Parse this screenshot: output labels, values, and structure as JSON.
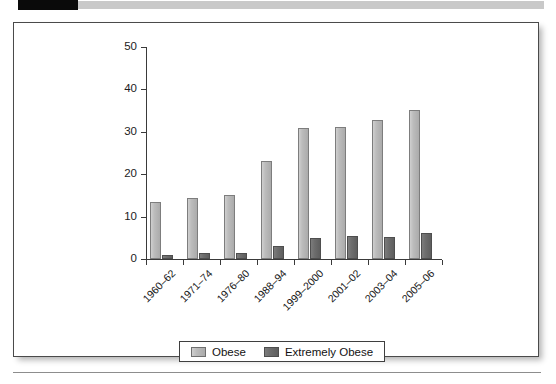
{
  "decor": {
    "top_tab_color": "#0a0a0a",
    "top_rule_color": "#c9c9c9",
    "bottom_rule_color": "#8d8d8d"
  },
  "legend": {
    "position": "bottom-center",
    "entries": [
      {
        "label": "Obese",
        "color": "#bcbcbc"
      },
      {
        "label": "Extremely Obese",
        "color": "#6d6d6d"
      }
    ]
  },
  "chart_data": {
    "type": "bar",
    "title": "",
    "subtitle": "",
    "xlabel": "",
    "ylabel": "",
    "ylim": [
      0,
      50
    ],
    "yticks": [
      0,
      10,
      20,
      30,
      40,
      50
    ],
    "grid": false,
    "legend_position": "bottom-center",
    "categories": [
      "1960–62",
      "1971–74",
      "1976–80",
      "1988–94",
      "1999–2000",
      "2001–02",
      "2003–04",
      "2005–06"
    ],
    "series": [
      {
        "name": "Obese",
        "color": "#bcbcbc",
        "values": [
          13.4,
          14.5,
          15.0,
          23.2,
          30.9,
          31.2,
          32.9,
          35.1
        ]
      },
      {
        "name": "Extremely Obese",
        "color": "#6d6d6d",
        "values": [
          0.9,
          1.3,
          1.4,
          3.0,
          4.9,
          5.4,
          5.2,
          6.2
        ]
      }
    ]
  }
}
